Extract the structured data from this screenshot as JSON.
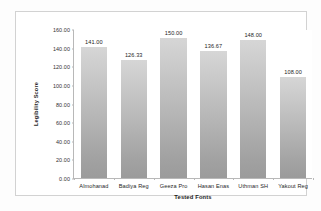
{
  "chart_data": {
    "type": "bar",
    "title": "",
    "xlabel": "Tested Fonts",
    "ylabel": "Legibility Score",
    "categories": [
      "Almohanad",
      "Badiya Reg",
      "Geeza Pro",
      "Hasan Enas",
      "Uthman SH",
      "Yakout Reg"
    ],
    "values": [
      141.0,
      126.33,
      150.0,
      136.67,
      148.0,
      108.0
    ],
    "data_labels": [
      "141.00",
      "126.33",
      "150.00",
      "136.67",
      "148.00",
      "108.00"
    ],
    "ylim": [
      0,
      160
    ],
    "ytick_values": [
      0,
      20,
      40,
      60,
      80,
      100,
      120,
      140,
      160
    ],
    "ytick_labels": [
      "0.00",
      "20.00",
      "40.00",
      "60.00",
      "80.00",
      "100.00",
      "120.00",
      "140.00",
      "160.00"
    ],
    "grid": false,
    "legend": false,
    "bar_color_top": "#d6d6d6",
    "bar_color_bottom": "#9b9b9b",
    "axis_color": "#b8b8b8",
    "plot_background": "#ffffff",
    "figure_background": "#fdfdfd"
  }
}
